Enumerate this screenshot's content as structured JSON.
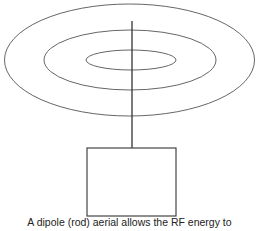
{
  "diagram": {
    "caption": "A dipole (rod) aerial allows the RF energy to",
    "elements": [
      "outer radiation ellipse",
      "middle radiation ellipse",
      "inner radiation ellipse",
      "dipole rod",
      "transmitter box"
    ],
    "stroke_color": "#555555"
  }
}
